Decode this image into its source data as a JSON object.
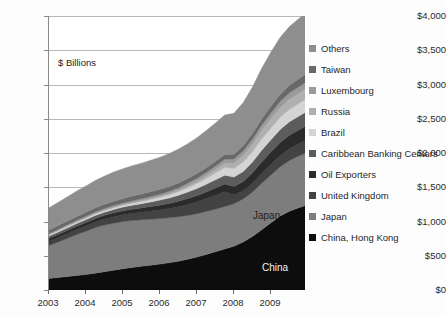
{
  "chart_data": {
    "type": "area",
    "stacked": true,
    "title": "",
    "subtitle": "",
    "annotation": "$ Billions",
    "xlabel": "",
    "ylabel": "",
    "ylim": [
      0,
      4000
    ],
    "ytick_labels": [
      "$4,000",
      "$3,500",
      "$3,000",
      "$2,500",
      "$2,000",
      "$1,500",
      "$1,000",
      "$500",
      "$0"
    ],
    "ytick_values": [
      4000,
      3500,
      3000,
      2500,
      2000,
      1500,
      1000,
      500,
      0
    ],
    "xtick_labels": [
      "2003",
      "2004",
      "2005",
      "2006",
      "2007",
      "2008",
      "2009"
    ],
    "xtick_values": [
      2003,
      2004,
      2005,
      2006,
      2007,
      2008,
      2009
    ],
    "xlim": [
      2003,
      2009.92
    ],
    "grid": "horizontal",
    "legend_position": "right",
    "plot_labels": [
      {
        "text": "Japan",
        "x": 2008.1,
        "y": 1150
      },
      {
        "text": "China",
        "x": 2008.35,
        "y": 380
      }
    ],
    "x": [
      2003.0,
      2003.25,
      2003.5,
      2003.75,
      2004.0,
      2004.25,
      2004.5,
      2004.75,
      2005.0,
      2005.25,
      2005.5,
      2005.75,
      2006.0,
      2006.25,
      2006.5,
      2006.75,
      2007.0,
      2007.25,
      2007.5,
      2007.75,
      2008.0,
      2008.25,
      2008.5,
      2008.75,
      2009.0,
      2009.25,
      2009.5,
      2009.75,
      2009.92
    ],
    "series": [
      {
        "name": "China, Hong Kong",
        "color": "#0d0d0d",
        "values": [
          168,
          182,
          196,
          212,
          228,
          246,
          268,
          288,
          310,
          330,
          348,
          362,
          378,
          398,
          420,
          448,
          480,
          520,
          560,
          600,
          640,
          700,
          780,
          880,
          980,
          1080,
          1150,
          1200,
          1230
        ]
      },
      {
        "name": "Japan",
        "color": "#7d7d7d",
        "values": [
          482,
          520,
          560,
          598,
          630,
          665,
          680,
          688,
          690,
          685,
          678,
          672,
          665,
          655,
          648,
          640,
          632,
          625,
          620,
          618,
          620,
          630,
          650,
          680,
          700,
          720,
          740,
          755,
          765
        ]
      },
      {
        "name": "United Kingdom",
        "color": "#434343",
        "values": [
          62,
          66,
          70,
          74,
          78,
          82,
          88,
          94,
          98,
          104,
          110,
          118,
          126,
          136,
          148,
          162,
          176,
          190,
          205,
          218,
          130,
          118,
          128,
          142,
          152,
          162,
          172,
          180,
          186
        ]
      },
      {
        "name": "Oil Exporters",
        "color": "#2b2b2b",
        "values": [
          42,
          44,
          46,
          48,
          50,
          52,
          54,
          56,
          58,
          60,
          62,
          66,
          70,
          74,
          78,
          84,
          90,
          96,
          104,
          112,
          122,
          136,
          152,
          168,
          182,
          192,
          198,
          202,
          206
        ]
      },
      {
        "name": "Caribbean Banking Centers",
        "color": "#5c5c5c",
        "values": [
          34,
          36,
          38,
          40,
          42,
          44,
          46,
          50,
          54,
          58,
          62,
          68,
          74,
          80,
          88,
          96,
          104,
          112,
          120,
          128,
          136,
          146,
          158,
          170,
          180,
          190,
          196,
          200,
          204
        ]
      },
      {
        "name": "Brazil",
        "color": "#d4d4d4",
        "values": [
          18,
          19,
          20,
          21,
          22,
          23,
          24,
          26,
          28,
          30,
          32,
          36,
          40,
          46,
          54,
          62,
          72,
          84,
          98,
          112,
          126,
          140,
          152,
          164,
          172,
          178,
          182,
          186,
          188
        ]
      },
      {
        "name": "Russia",
        "color": "#b0b0b0",
        "values": [
          6,
          6,
          7,
          7,
          8,
          8,
          9,
          10,
          11,
          12,
          13,
          14,
          16,
          18,
          22,
          28,
          34,
          42,
          52,
          64,
          78,
          96,
          112,
          128,
          138,
          144,
          148,
          150,
          152
        ]
      },
      {
        "name": "Luxembourg",
        "color": "#9a9a9a",
        "values": [
          14,
          15,
          16,
          17,
          18,
          19,
          20,
          21,
          22,
          24,
          26,
          28,
          30,
          33,
          36,
          40,
          44,
          48,
          52,
          56,
          60,
          66,
          72,
          78,
          84,
          88,
          92,
          94,
          96
        ]
      },
      {
        "name": "Taiwan",
        "color": "#686868",
        "values": [
          50,
          52,
          54,
          56,
          58,
          60,
          62,
          64,
          66,
          68,
          69,
          70,
          70,
          70,
          69,
          68,
          68,
          68,
          68,
          69,
          70,
          74,
          80,
          88,
          96,
          104,
          110,
          114,
          116
        ]
      },
      {
        "name": "Others",
        "color": "#8e8e8e",
        "values": [
          324,
          340,
          356,
          372,
          386,
          400,
          412,
          424,
          434,
          444,
          452,
          460,
          470,
          482,
          494,
          508,
          524,
          542,
          560,
          578,
          598,
          630,
          680,
          740,
          790,
          830,
          860,
          880,
          890
        ]
      }
    ]
  },
  "legend": {
    "items": [
      {
        "label": "Others",
        "color": "#8e8e8e"
      },
      {
        "label": "Taiwan",
        "color": "#686868"
      },
      {
        "label": "Luxembourg",
        "color": "#9a9a9a"
      },
      {
        "label": "Russia",
        "color": "#b0b0b0"
      },
      {
        "label": "Brazil",
        "color": "#d4d4d4"
      },
      {
        "label": "Caribbean Banking Centers",
        "color": "#5c5c5c"
      },
      {
        "label": "Oil Exporters",
        "color": "#2b2b2b"
      },
      {
        "label": "United Kingdom",
        "color": "#434343"
      },
      {
        "label": "Japan",
        "color": "#7d7d7d"
      },
      {
        "label": "China, Hong Kong",
        "color": "#0d0d0d"
      }
    ]
  }
}
